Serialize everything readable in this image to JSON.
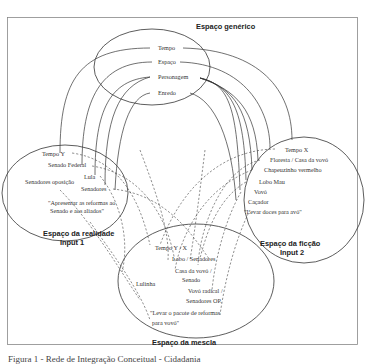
{
  "diagram": {
    "generic_space": {
      "title": "Espaço genérico",
      "items": [
        "Tempo",
        "Espaço",
        "Personagem",
        "Enredo"
      ]
    },
    "input1": {
      "title_line1": "Espaço da realidade",
      "title_line2": "Input 1",
      "items": [
        "Tempo Y",
        "Senado Federal",
        "Lula",
        "Senadores oposição",
        "Senadores"
      ],
      "quote_line1": "\"Apresentar as reformas ao",
      "quote_line2": "Senado e aos aliados\""
    },
    "input2": {
      "title_line1": "Espaço da ficção",
      "title_line2": "Input 2",
      "items": [
        "Tempo X",
        "Floresta / Casa da vovó",
        "Chapeuzinho vermelho",
        "Lobo Mau",
        "Vovó",
        "Caçador"
      ],
      "quote": "\"Levar doces para avó\""
    },
    "blend": {
      "title": "Espaço da mescla",
      "items": [
        "Tempo Y / X",
        "Lobo / Senadores",
        "Casa da vovó /",
        "Senado",
        "Lulinha",
        "Vovó radical /",
        "Senadores OP."
      ],
      "quote_line1": "\"Levar o pacote de reformas",
      "quote_line2": "para vovó\""
    },
    "caption": "Figura 1 - Rede de Integração Conceitual - Cidadania"
  }
}
